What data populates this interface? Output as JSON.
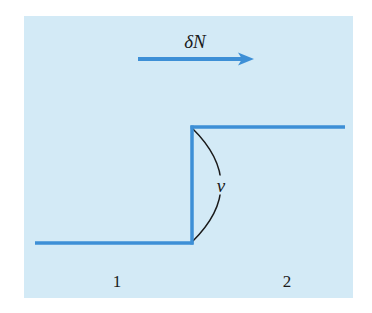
{
  "diagram": {
    "type": "step-front-schematic",
    "labels": {
      "flux": "δN",
      "velocity": "v",
      "region_left": "1",
      "region_right": "2"
    },
    "colors": {
      "panel_background": "#d3eaf6",
      "line": "#3d8fd6",
      "arc": "#1a1a1a",
      "text": "#1a1a1a"
    },
    "elements": {
      "flux_arrow": {
        "direction": "right",
        "from_x": 138,
        "to_x": 253,
        "y": 59
      },
      "lower_level": {
        "from_x": 35,
        "to_x": 192,
        "y": 243
      },
      "step_front": {
        "x": 192,
        "from_y": 127,
        "to_y": 243
      },
      "upper_level": {
        "from_x": 192,
        "to_x": 345,
        "y": 127
      },
      "velocity_arc": {
        "start": [
          192,
          128
        ],
        "end": [
          192,
          242
        ],
        "bulge_x": 221
      }
    }
  }
}
